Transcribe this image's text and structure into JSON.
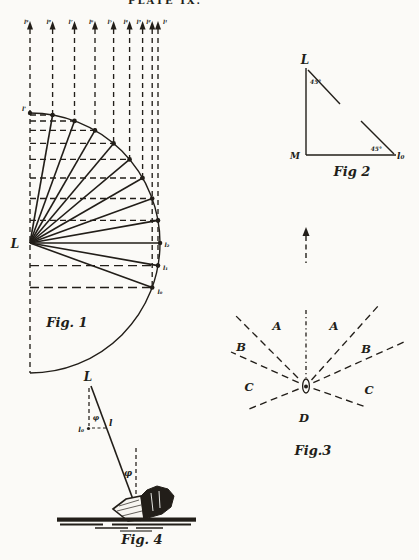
{
  "colors": {
    "paper": "#fbfaf7",
    "ink": "#221e19"
  },
  "header": {
    "label": "PLATE IX."
  },
  "fig1": {
    "caption": "Fig. 1",
    "center_label": "L",
    "top_point_label": "l'",
    "arrow_labels": [
      "l⁹",
      "l⁸",
      "l⁷",
      "l⁶",
      "l⁵",
      "l⁴",
      "l³",
      "l²",
      "l¹"
    ],
    "right_point_labels": [
      "l₂",
      "l₁",
      "l₀"
    ]
  },
  "fig2": {
    "caption": "Fig 2",
    "apex_label": "L",
    "corner_label": "M",
    "right_end_label": "l₀",
    "upper_angle": "45°",
    "lower_angle": "45°"
  },
  "fig3": {
    "caption": "Fig.3",
    "sectors": {
      "a_left": "A",
      "a_right": "A",
      "b_left": "B",
      "b_right": "B",
      "c_left": "C",
      "c_right": "C",
      "d": "D"
    }
  },
  "fig4": {
    "caption": "Fig. 4",
    "top_label": "L",
    "l0_label": "l₀",
    "l_label": "l",
    "upper_angle": "φ",
    "lower_angle": "φ"
  }
}
